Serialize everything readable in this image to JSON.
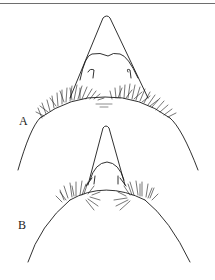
{
  "figure": {
    "panels": [
      {
        "label": "A",
        "description": "head outline with triangular rostrum and two dense setal tufts"
      },
      {
        "label": "B",
        "description": "head outline with narrower rostrum and two smaller setal tufts"
      }
    ],
    "colors": {
      "line": "#1a1a1a",
      "background": "#ffffff",
      "rule": "#6e6e6e"
    }
  }
}
